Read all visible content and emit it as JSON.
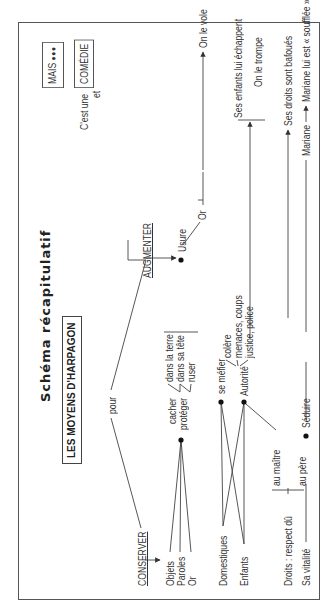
{
  "title": "Schéma récapitulatif",
  "header_box": "LES MOYENS D'HARPAGON",
  "pour": "pour",
  "conserver": {
    "label": "CONSERVER",
    "objects": [
      "Objets",
      "Paroles",
      "Or"
    ],
    "actions": [
      "cacher",
      "protéger"
    ],
    "means": [
      "dans la terre",
      "dans sa tête",
      "ruser"
    ]
  },
  "augmenter": {
    "label": "AUGMENTER",
    "means": "Usure",
    "result": "Or"
  },
  "people": {
    "targets": [
      "Domestiques",
      "Enfants"
    ],
    "actions": [
      "se méfier",
      "Autorité"
    ],
    "authority_means": [
      "colère",
      "menaces, coups",
      "justice, police"
    ]
  },
  "rights": {
    "label": "Droits : respect dû",
    "items": [
      "au maître",
      "au père"
    ]
  },
  "vitality": {
    "label": "Sa vitalité",
    "action": "Séduire",
    "target": "Mariane"
  },
  "outcomes": {
    "steal": "On le vole",
    "children": "Ses enfants lui échappent",
    "deceive": "On le trompe",
    "rights": "Ses droits sont bafoués",
    "mariane": "Mariane lui est « soufflée »."
  },
  "conclusion": {
    "prefix": "C'est une",
    "box1": "COMÉDIE",
    "connector": "et",
    "box2": "MAIS",
    "dots": "●●●"
  }
}
